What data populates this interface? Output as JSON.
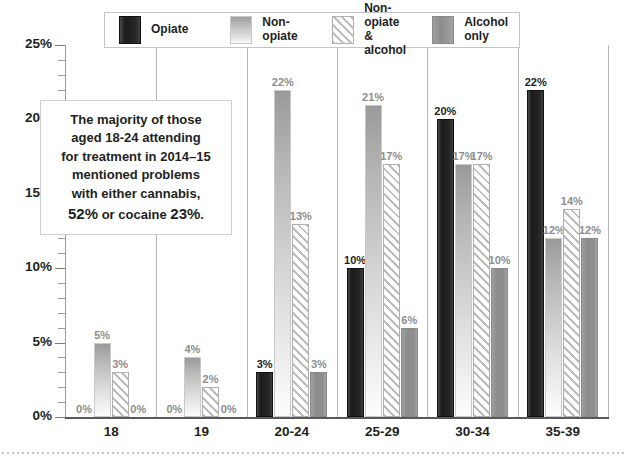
{
  "chart_data": {
    "type": "bar",
    "title": "",
    "xlabel": "",
    "ylabel": "",
    "ylim": [
      0,
      25
    ],
    "ytick_labels": [
      "0%",
      "5%",
      "10%",
      "15%",
      "20%",
      "25%"
    ],
    "ytick_values": [
      0,
      5,
      10,
      15,
      20,
      25
    ],
    "minor_tick_step": 1,
    "grid": false,
    "legend_position": "top",
    "categories": [
      "18",
      "19",
      "20-24",
      "25-29",
      "30-34",
      "35-39"
    ],
    "series": [
      {
        "name": "Opiate",
        "values": [
          0,
          0,
          3,
          10,
          20,
          22
        ],
        "labels": [
          "0%",
          "0%",
          "3%",
          "10%",
          "20%",
          "22%"
        ]
      },
      {
        "name": "Non-opiate",
        "values": [
          5,
          4,
          22,
          21,
          17,
          12
        ],
        "labels": [
          "5%",
          "4%",
          "22%",
          "21%",
          "17%",
          "12%"
        ]
      },
      {
        "name": "Non-opiate & alcohol",
        "values": [
          3,
          2,
          13,
          17,
          17,
          14
        ],
        "labels": [
          "3%",
          "2%",
          "13%",
          "17%",
          "17%",
          "14%"
        ]
      },
      {
        "name": "Alcohol only",
        "values": [
          0,
          0,
          3,
          6,
          10,
          12
        ],
        "labels": [
          "0%",
          "0%",
          "3%",
          "6%",
          "10%",
          "12%"
        ]
      }
    ],
    "annotations": [
      {
        "text": "The majority of those aged 18-24 attending for treatment in 2014-15 mentioned problems with either cannabis, 52% or cocaine 23%."
      }
    ]
  },
  "legend": {
    "items": [
      {
        "label": "Opiate",
        "swatch": "opiate"
      },
      {
        "label": "Non-opiate",
        "swatch": "nonopiate"
      },
      {
        "label": "Non-opiate\n& alcohol",
        "swatch": "nonopiate-alc"
      },
      {
        "label": "Alcohol only",
        "swatch": "alcohol"
      }
    ]
  },
  "annotation": {
    "line1": "The majority of those",
    "line2": "aged 18-24 attending",
    "line3": "for treatment in 2014–15",
    "line4": "mentioned problems",
    "line5": "with either cannabis,",
    "line6_pre": "52%",
    "line6_mid": " or cocaine ",
    "line6_post": "23%",
    "line6_end": "."
  },
  "colors": {
    "opiate": "#1c1c1c",
    "non_opiate": "#c2c2c2",
    "non_opiate_alcohol": "#bdbdbd",
    "alcohol_only": "#8c8c8c",
    "axis": "#58595b",
    "label_gray": "#8d8d8d",
    "text": "#231f20"
  }
}
